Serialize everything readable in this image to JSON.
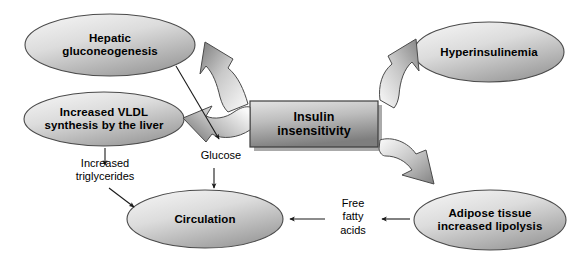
{
  "diagram": {
    "colors": {
      "node_fill_light": "#f2f2f2",
      "node_fill_dark": "#9d9d9d",
      "node_stroke": "#4a4a4a",
      "box_fill_light": "#d9d9d9",
      "box_fill_dark": "#8a8a8a",
      "box_stroke": "#3c3c3c",
      "arrow_fill_light": "#fbfbfb",
      "arrow_fill_dark": "#8c8c8c",
      "arrow_stroke": "#4a4a4a",
      "thin_arrow": "#1a1a1a",
      "text": "#000000",
      "background": "#ffffff"
    },
    "nodes": [
      {
        "id": "hepatic-gluconeogenesis",
        "shape": "ellipse",
        "lines": [
          "Hepatic",
          "gluconeogenesis"
        ],
        "cx": 110,
        "cy": 45,
        "rx": 85,
        "ry": 31
      },
      {
        "id": "increased-vldl",
        "shape": "ellipse",
        "lines": [
          "Increased VLDL",
          "synthesis by the liver"
        ],
        "cx": 104,
        "cy": 119,
        "rx": 80,
        "ry": 27
      },
      {
        "id": "insulin-insensitivity",
        "shape": "box",
        "lines": [
          "Insulin",
          "insensitivity"
        ],
        "x": 250,
        "y": 101,
        "w": 128,
        "h": 46
      },
      {
        "id": "hyperinsulinemia",
        "shape": "ellipse",
        "lines": [
          "Hyperinsulinemia"
        ],
        "cx": 489,
        "cy": 52,
        "rx": 75,
        "ry": 30
      },
      {
        "id": "adipose-tissue",
        "shape": "ellipse",
        "lines": [
          "Adipose tissue",
          "increased lipolysis"
        ],
        "cx": 490,
        "cy": 220,
        "rx": 76,
        "ry": 30
      },
      {
        "id": "circulation",
        "shape": "ellipse",
        "lines": [
          "Circulation"
        ],
        "cx": 205,
        "cy": 219,
        "rx": 78,
        "ry": 29
      }
    ],
    "edge_labels": [
      {
        "id": "glucose",
        "lines": [
          "Glucose"
        ],
        "x": 186,
        "y": 150,
        "w": 70
      },
      {
        "id": "increased-triglycerides",
        "lines": [
          "Increased",
          "triglycerides"
        ],
        "x": 62,
        "y": 158,
        "w": 86
      },
      {
        "id": "free-fatty-acids",
        "lines": [
          "Free",
          "fatty",
          "acids"
        ],
        "x": 330,
        "y": 198,
        "w": 46
      }
    ],
    "edges": [
      {
        "id": "insulin-to-hepatic",
        "style": "block-curved",
        "from": "insulin-insensitivity",
        "to": "hepatic-gluconeogenesis"
      },
      {
        "id": "insulin-to-hyperinsulinemia",
        "style": "block-curved",
        "from": "insulin-insensitivity",
        "to": "hyperinsulinemia"
      },
      {
        "id": "insulin-to-vldl",
        "style": "block-curved",
        "from": "insulin-insensitivity",
        "to": "increased-vldl"
      },
      {
        "id": "insulin-to-adipose",
        "style": "block-curved",
        "from": "insulin-insensitivity",
        "to": "adipose-tissue"
      },
      {
        "id": "hepatic-to-glucose",
        "style": "thin",
        "from": "hepatic-gluconeogenesis",
        "to": "glucose"
      },
      {
        "id": "glucose-to-circulation",
        "style": "thin",
        "from": "glucose",
        "to": "circulation"
      },
      {
        "id": "vldl-to-triglycerides",
        "style": "thin",
        "from": "increased-vldl",
        "to": "increased-triglycerides"
      },
      {
        "id": "triglycerides-to-circulation",
        "style": "thin",
        "from": "increased-triglycerides",
        "to": "circulation"
      },
      {
        "id": "adipose-to-ffa",
        "style": "thin",
        "from": "adipose-tissue",
        "to": "free-fatty-acids"
      },
      {
        "id": "ffa-to-circulation",
        "style": "thin",
        "from": "free-fatty-acids",
        "to": "circulation"
      }
    ]
  }
}
